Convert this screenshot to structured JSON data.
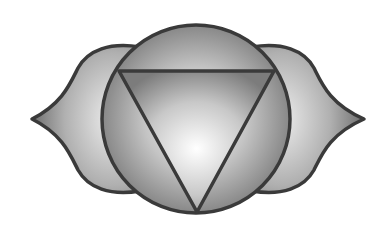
{
  "image": {
    "subject": "Ajna chakra symbol",
    "description": "Grayscale circle with inscribed downward triangle flanked by two petals",
    "colors": {
      "background": "#ffffff",
      "outline": "#3a3a3a",
      "shade_dark": "#6e6e6e",
      "shade_mid": "#a8a8a8",
      "highlight": "#f4f4f4"
    },
    "elements": [
      "left-petal",
      "right-petal",
      "center-circle",
      "inverted-triangle"
    ]
  }
}
